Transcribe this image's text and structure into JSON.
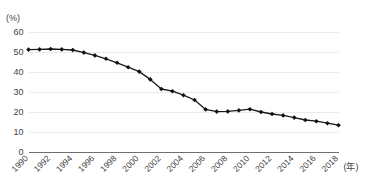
{
  "chart_data": {
    "type": "line",
    "title": "",
    "xlabel": "(年)",
    "ylabel": "(%)",
    "ylim": [
      0,
      60
    ],
    "yticks": [
      0,
      10,
      20,
      30,
      40,
      50,
      60
    ],
    "xlim": [
      1990,
      2018
    ],
    "xticks": [
      1990,
      1992,
      1994,
      1996,
      1998,
      2000,
      2002,
      2004,
      2006,
      2008,
      2010,
      2012,
      2014,
      2016,
      2018
    ],
    "grid": true,
    "legend": "none",
    "marker": "diamond",
    "line_color": "#1a1a1a",
    "grid_color": "#e9ebee",
    "axis_color": "#6f6f6f",
    "x": [
      1990,
      1991,
      1992,
      1993,
      1994,
      1995,
      1996,
      1997,
      1998,
      1999,
      2000,
      2001,
      2002,
      2003,
      2004,
      2005,
      2006,
      2007,
      2008,
      2009,
      2010,
      2011,
      2012,
      2013,
      2014,
      2015,
      2016,
      2017,
      2018
    ],
    "values": [
      51.2,
      51.3,
      51.5,
      51.3,
      51.0,
      49.7,
      48.3,
      46.6,
      44.6,
      42.4,
      40.2,
      36.3,
      31.5,
      30.4,
      28.4,
      26.0,
      21.3,
      20.2,
      20.3,
      20.8,
      21.4,
      20.0,
      19.0,
      18.3,
      17.2,
      16.0,
      15.4,
      14.4,
      13.4
    ],
    "categories": [
      "1990",
      "1991",
      "1992",
      "1993",
      "1994",
      "1995",
      "1996",
      "1997",
      "1998",
      "1999",
      "2000",
      "2001",
      "2002",
      "2003",
      "2004",
      "2005",
      "2006",
      "2007",
      "2008",
      "2009",
      "2010",
      "2011",
      "2012",
      "2013",
      "2014",
      "2015",
      "2016",
      "2017",
      "2018"
    ]
  },
  "axes": {
    "y_unit_label": "(%)",
    "x_unit_label": "(年)",
    "y_tick_labels": [
      "60",
      "50",
      "40",
      "30",
      "20",
      "10",
      "0"
    ],
    "x_tick_labels": [
      "1990",
      "1992",
      "1994",
      "1996",
      "1998",
      "2000",
      "2002",
      "2004",
      "2006",
      "2008",
      "2010",
      "2012",
      "2014",
      "2016",
      "2018"
    ]
  },
  "title": {
    "text": ""
  }
}
